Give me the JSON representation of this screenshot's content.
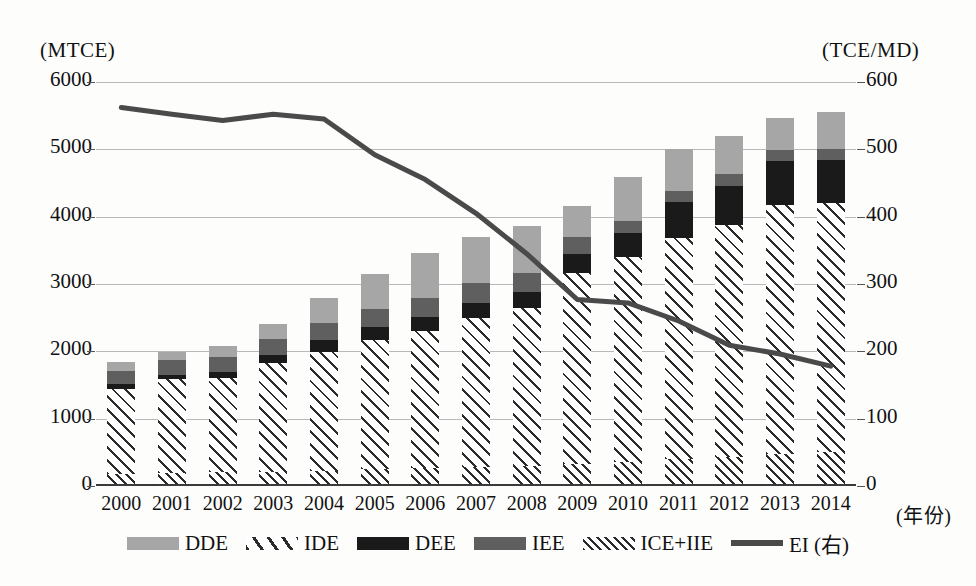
{
  "chart_data": {
    "type": "bar",
    "title": "",
    "xlabel": "(年份)",
    "ylabel": "(MTCE)",
    "y2label": "(TCE/MD)",
    "grid": true,
    "legend_position": "bottom",
    "categories": [
      "2000",
      "2001",
      "2002",
      "2003",
      "2004",
      "2005",
      "2006",
      "2007",
      "2008",
      "2009",
      "2010",
      "2011",
      "2012",
      "2013",
      "2014"
    ],
    "ylim": [
      0,
      6000
    ],
    "yticks": [
      0,
      1000,
      2000,
      3000,
      4000,
      5000,
      6000
    ],
    "y2lim": [
      0,
      600
    ],
    "y2ticks": [
      0,
      100,
      200,
      300,
      400,
      500,
      600
    ],
    "stack_order_bottom_to_top": [
      "ICE+IIE",
      "IDE",
      "DEE",
      "IEE",
      "DDE"
    ],
    "series": [
      {
        "name": "ICE+IIE",
        "axis": "left",
        "style": "cross-hatch",
        "values": [
          180,
          195,
          205,
          215,
          225,
          250,
          265,
          275,
          290,
          320,
          360,
          400,
          430,
          480,
          500
        ]
      },
      {
        "name": "IDE",
        "axis": "left",
        "style": "diagonal-hatch",
        "values": [
          1260,
          1390,
          1400,
          1610,
          1760,
          1920,
          2040,
          2220,
          2350,
          2840,
          3040,
          3280,
          3450,
          3700,
          3710
        ]
      },
      {
        "name": "DEE",
        "axis": "left",
        "style": "black",
        "values": [
          70,
          70,
          90,
          120,
          180,
          190,
          200,
          230,
          240,
          280,
          360,
          540,
          580,
          640,
          630
        ]
      },
      {
        "name": "IEE",
        "axis": "left",
        "style": "dark-gray",
        "values": [
          200,
          210,
          220,
          240,
          260,
          270,
          290,
          290,
          280,
          260,
          180,
          160,
          170,
          170,
          170
        ]
      },
      {
        "name": "DDE",
        "axis": "left",
        "style": "light-gray",
        "values": [
          130,
          130,
          160,
          215,
          360,
          520,
          660,
          680,
          700,
          460,
          650,
          620,
          570,
          480,
          540
        ]
      },
      {
        "name": "EI (右)",
        "axis": "right",
        "style": "line",
        "values": [
          562,
          552,
          543,
          552,
          545,
          492,
          455,
          405,
          345,
          277,
          272,
          245,
          209,
          196,
          178
        ]
      }
    ],
    "bar_totals": [
      1840,
      1995,
      2075,
      2400,
      2785,
      3150,
      3455,
      3695,
      3860,
      4160,
      4590,
      5000,
      5200,
      5470,
      5550
    ]
  },
  "legend": {
    "items": [
      {
        "label": "DDE",
        "swatch": "light-gray-swatch"
      },
      {
        "label": "IDE",
        "swatch": "diagonal-hatch-swatch"
      },
      {
        "label": "DEE",
        "swatch": "black-swatch"
      },
      {
        "label": "IEE",
        "swatch": "dark-gray-swatch"
      },
      {
        "label": "ICE+IIE",
        "swatch": "cross-hatch-swatch"
      },
      {
        "label": "EI (右)",
        "swatch": "line-swatch"
      }
    ]
  },
  "colors": {
    "dde": "#a6a6a6",
    "iee": "#5f5f5f",
    "dee": "#1a1a1a",
    "hatch": "#2b2b2b",
    "line": "#4a4a4a",
    "grid": "#b9b9b9",
    "axis": "#3a3a3a"
  }
}
